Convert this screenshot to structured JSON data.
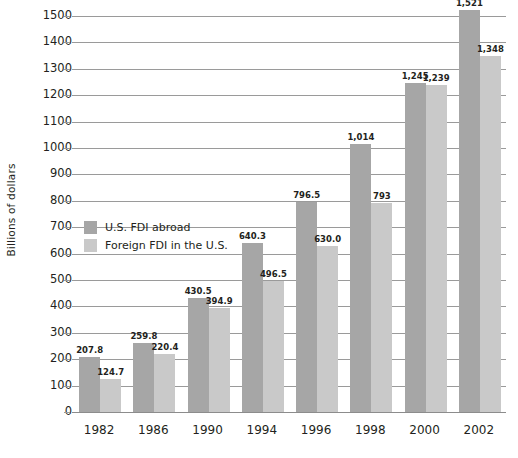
{
  "chart_data": {
    "type": "bar",
    "title": "",
    "subtitle": "",
    "xlabel": "",
    "ylabel": "Billions of dollars",
    "categories": [
      "1982",
      "1986",
      "1990",
      "1994",
      "1996",
      "1998",
      "2000",
      "2002"
    ],
    "series": [
      {
        "name": "U.S. FDI abroad",
        "color": "#a6a6a6",
        "values": [
          207.8,
          259.8,
          430.5,
          640.3,
          796.5,
          1014,
          1245,
          1521
        ],
        "labels": [
          "207.8",
          "259.8",
          "430.5",
          "640.3",
          "796.5",
          "1,014",
          "1,245",
          "1,521"
        ]
      },
      {
        "name": "Foreign FDI in the U.S.",
        "color": "#c9c9c9",
        "values": [
          124.7,
          220.4,
          394.9,
          496.5,
          630.0,
          793,
          1239,
          1348
        ],
        "labels": [
          "124.7",
          "220.4",
          "394.9",
          "496.5",
          "630.0",
          "793",
          "1,239",
          "1,348"
        ]
      }
    ],
    "ylim": [
      0,
      1500
    ],
    "ytick_step": 100,
    "ytick_labels": [
      "0",
      "100",
      "200",
      "300",
      "400",
      "500",
      "600",
      "700",
      "800",
      "900",
      "1000",
      "1100",
      "1200",
      "1300",
      "1400",
      "1500"
    ],
    "grid": "horizontal",
    "legend_position": "inside-upper-left",
    "axis_line_color": "#9a9a9a",
    "background_color": "#ffffff"
  },
  "legend": {
    "items": [
      {
        "label": "U.S. FDI abroad",
        "swatch": "dark"
      },
      {
        "label": "Foreign FDI in the U.S.",
        "swatch": "light"
      }
    ]
  },
  "axes": {
    "y_title": "Billions of dollars"
  }
}
